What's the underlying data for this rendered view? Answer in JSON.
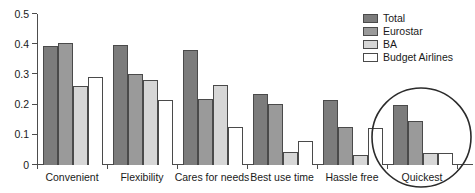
{
  "chart_data": {
    "type": "bar",
    "title": "",
    "xlabel": "",
    "ylabel": "",
    "ylim": [
      0,
      0.5
    ],
    "grid": false,
    "legend_position": "top-right",
    "categories": [
      "Convenient",
      "Flexibility",
      "Cares for needs",
      "Best use time",
      "Hassle free",
      "Quickest"
    ],
    "y_ticks": [
      "0",
      "0.1",
      "0.2",
      "0.3",
      "0.4",
      "0.5"
    ],
    "y_tick_values": [
      0,
      0.1,
      0.2,
      0.3,
      0.4,
      0.5
    ],
    "series": [
      {
        "name": "Total",
        "color": "#7c7c7c",
        "values": [
          0.393,
          0.396,
          0.38,
          0.236,
          0.215,
          0.198
        ]
      },
      {
        "name": "Eurostar",
        "color": "#9a9a9a",
        "values": [
          0.403,
          0.3,
          0.22,
          0.201,
          0.127,
          0.146
        ]
      },
      {
        "name": "BA",
        "color": "#d6d6d6",
        "values": [
          0.261,
          0.283,
          0.265,
          0.044,
          0.034,
          0.041
        ]
      },
      {
        "name": "Budget Airlines",
        "color": "#ffffff",
        "values": [
          0.293,
          0.215,
          0.127,
          0.081,
          0.121,
          0.041
        ]
      }
    ],
    "annotations": [
      {
        "type": "ellipse",
        "label": "hand-drawn-circle-around-quickest",
        "target_category": "Quickest"
      }
    ]
  },
  "legend": {
    "items": [
      {
        "label": "Total"
      },
      {
        "label": "Eurostar"
      },
      {
        "label": "BA"
      },
      {
        "label": "Budget Airlines"
      }
    ]
  }
}
